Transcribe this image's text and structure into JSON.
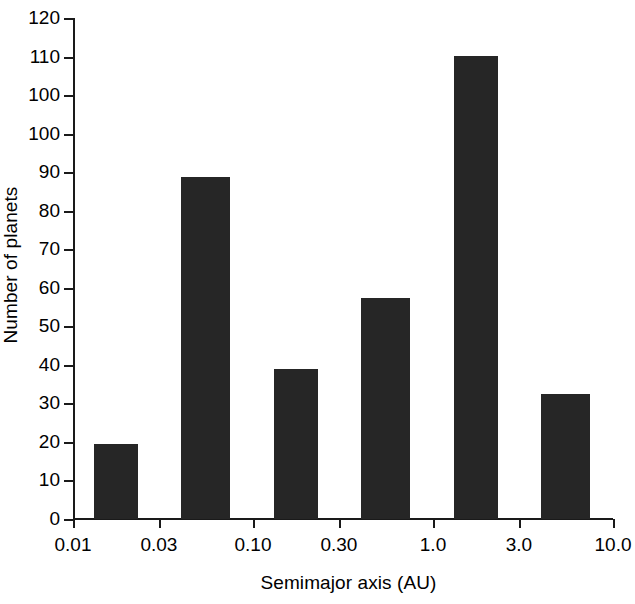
{
  "chart_data": {
    "type": "bar",
    "title": "",
    "xlabel": "Semimajor axis (AU)",
    "ylabel": "Number of planets",
    "xscale": "log",
    "grid": false,
    "legend": null,
    "xlim": [
      0.01,
      10.0
    ],
    "ylim": [
      0,
      120
    ],
    "x_tick_labels": [
      "0.01",
      "0.03",
      "0.10",
      "0.30",
      "1.0",
      "3.0",
      "10.0"
    ],
    "x_tick_values": [
      0.01,
      0.03,
      0.1,
      0.3,
      1.0,
      3.0,
      10.0
    ],
    "y_tick_labels": [
      "120",
      "110",
      "100",
      "100",
      "90",
      "80",
      "70",
      "60",
      "50",
      "40",
      "30",
      "20",
      "10",
      "0"
    ],
    "y_tick_values": [
      120,
      110,
      100,
      95,
      90,
      80,
      70,
      60,
      50,
      40,
      30,
      20,
      10,
      0
    ],
    "categories": [
      "0.01-0.03",
      "0.03-0.10",
      "0.10-0.30",
      "0.30-1.0",
      "1.0-3.0",
      "3.0-10.0"
    ],
    "values": [
      18,
      82,
      36,
      53,
      111,
      30
    ],
    "bar_color": "#262626",
    "bar_edge_color": "#262626"
  },
  "axes": {
    "y_title": "Number of planets",
    "x_title": "Semimajor axis (AU)"
  },
  "colors": {
    "background": "#ffffff",
    "axis": "#1a1a1a",
    "text": "#000000",
    "bar": "#262626"
  }
}
